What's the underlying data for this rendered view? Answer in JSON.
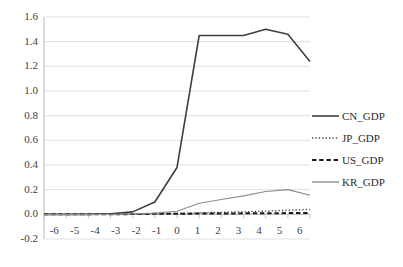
{
  "chart_data": {
    "type": "line",
    "title": "",
    "xlabel": "",
    "ylabel": "",
    "x": [
      -6,
      -5,
      -4,
      -3,
      -2,
      -1,
      0,
      1,
      2,
      3,
      4,
      5,
      6
    ],
    "xlim": [
      -6,
      6
    ],
    "ylim": [
      -0.2,
      1.6
    ],
    "yticks": [
      1.6,
      1.4,
      1.2,
      1.0,
      0.8,
      0.6,
      0.4,
      0.2,
      0.0,
      -0.2
    ],
    "ytick_labels": [
      "1.6",
      "1.4",
      "1.2",
      "1.0",
      "0.8",
      "0.6",
      "0.4",
      "0.2",
      "0.0",
      "-0.2"
    ],
    "xtick_labels": [
      "-6",
      "-5",
      "-4",
      "-3",
      "-2",
      "-1",
      "0",
      "1",
      "2",
      "3",
      "4",
      "5",
      "6"
    ],
    "grid": true,
    "grid_axis": "y",
    "legend_position": "right",
    "series": [
      {
        "name": "CN_GDP",
        "style": "solid",
        "color": "#3f3f3f",
        "width": 1.6,
        "values": [
          0.0,
          0.0,
          0.0,
          0.005,
          0.02,
          0.1,
          0.38,
          1.45,
          1.45,
          1.45,
          1.5,
          1.46,
          1.24
        ]
      },
      {
        "name": "JP_GDP",
        "style": "dotted",
        "color": "#4a4a4a",
        "width": 1.4,
        "values": [
          0.0,
          0.0,
          0.0,
          0.0,
          0.002,
          0.004,
          0.008,
          0.012,
          0.016,
          0.02,
          0.026,
          0.033,
          0.04
        ]
      },
      {
        "name": "US_GDP",
        "style": "dashed",
        "color": "#1a1a1a",
        "width": 2.0,
        "values": [
          0.0,
          0.0,
          0.0,
          0.0,
          0.002,
          0.004,
          0.005,
          0.006,
          0.007,
          0.008,
          0.009,
          0.01,
          0.012
        ]
      },
      {
        "name": "KR_GDP",
        "style": "solid",
        "color": "#8c8c8c",
        "width": 1.2,
        "values": [
          0.0,
          0.0,
          0.0,
          0.0,
          0.004,
          0.01,
          0.025,
          0.09,
          0.12,
          0.15,
          0.185,
          0.2,
          0.155
        ]
      }
    ]
  },
  "legend": {
    "items": [
      {
        "label": "CN_GDP"
      },
      {
        "label": "JP_GDP"
      },
      {
        "label": "US_GDP"
      },
      {
        "label": "KR_GDP"
      }
    ]
  },
  "colors": {
    "grid": "#d9d9d9",
    "axis": "#bfbfbf",
    "text": "#404040",
    "background": "#ffffff"
  }
}
